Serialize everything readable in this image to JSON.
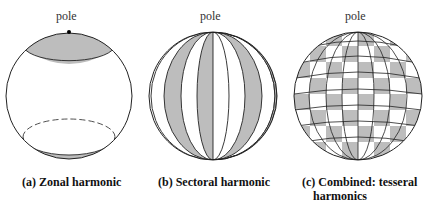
{
  "panels": [
    {
      "pole_label": "pole",
      "caption": "(a) Zonal harmonic"
    },
    {
      "pole_label": "pole",
      "caption": "(b) Sectoral harmonic"
    },
    {
      "pole_label": "pole",
      "caption_line1": "(c) Combined: tesseral",
      "caption_line2": "harmonics"
    }
  ],
  "colors": {
    "shade": "#bdbdbd",
    "line": "#222222",
    "background": "#ffffff"
  }
}
